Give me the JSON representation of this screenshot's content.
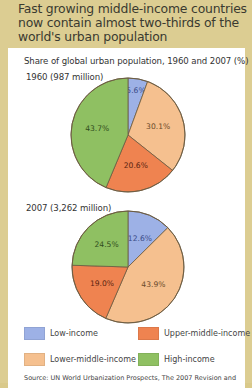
{
  "title": "Fast growing middle-income countries now contain almost two-thirds of the world's urban population",
  "subtitle": "Share of global urban population, 1960 and 2007 (%)",
  "colors": {
    "low_income": "#9db1e6",
    "lower_middle_income": "#f5c08f",
    "upper_middle_income": "#ef8350",
    "high_income": "#8fc062",
    "background": "#dccd92",
    "panel": "#ffffff"
  },
  "legend": [
    {
      "label": "Low-income",
      "color": "#9db1e6"
    },
    {
      "label": "Upper-middle-income",
      "color": "#ef8350"
    },
    {
      "label": "Lower-middle-income",
      "color": "#f5c08f"
    },
    {
      "label": "High-income",
      "color": "#8fc062"
    }
  ],
  "source": "Source: UN World Urbanization Prospects, The 2007 Revision and",
  "chart_data": [
    {
      "type": "pie",
      "title": "1960 (987 million)",
      "categories": [
        "Low-income",
        "Lower-middle-income",
        "Upper-middle-income",
        "High-income"
      ],
      "values": [
        5.6,
        30.1,
        20.6,
        43.7
      ],
      "labels": [
        "5.6%",
        "30.1%",
        "20.6%",
        "43.7%"
      ],
      "start_angle": "12 o'clock, clockwise"
    },
    {
      "type": "pie",
      "title": "2007 (3,262 million)",
      "categories": [
        "Low-income",
        "Lower-middle-income",
        "Upper-middle-income",
        "High-income"
      ],
      "values": [
        12.6,
        43.9,
        19.0,
        24.5
      ],
      "labels": [
        "12.6%",
        "43.9%",
        "19.0%",
        "24.5%"
      ],
      "start_angle": "12 o'clock, clockwise"
    }
  ]
}
